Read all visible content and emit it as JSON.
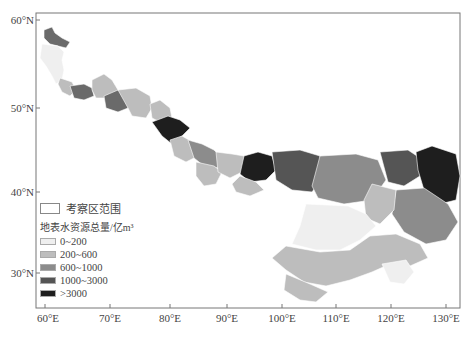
{
  "map": {
    "axes": {
      "x_ticks": [
        "60°E",
        "70°E",
        "80°E",
        "90°E",
        "100°E",
        "110°E",
        "120°E",
        "130°E"
      ],
      "y_ticks": [
        "60°N",
        "50°N",
        "40°N",
        "30°N"
      ]
    },
    "legend": {
      "boundary_label": "考察区范围",
      "title": "地表水资源总量/亿m³",
      "classes": [
        {
          "label": "0~200",
          "color": "#efefef"
        },
        {
          "label": "200~600",
          "color": "#bdbdbd"
        },
        {
          "label": "600~1000",
          "color": "#8c8c8c"
        },
        {
          "label": "1000~3000",
          "color": "#555555"
        },
        {
          "label": ">3000",
          "color": "#1e1e1e"
        }
      ]
    }
  }
}
